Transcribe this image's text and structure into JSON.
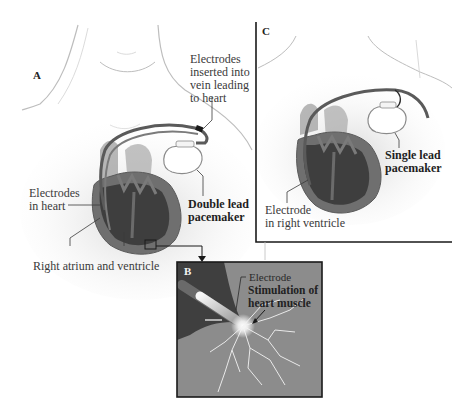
{
  "figure": {
    "type": "medical illustration",
    "colors": {
      "background": "#ffffff",
      "skin_outline": "#b8b8b8",
      "heart_dark": "#3c3c3c",
      "heart_mid": "#6d6d6d",
      "lead_wire": "#5a5a5a",
      "panel_border": "#1a1a1a",
      "panel_b_bg": "#8a8a8a",
      "spark": "#ffffff"
    }
  },
  "panels": {
    "a": {
      "letter": "A",
      "labels": {
        "electrodes_vein": [
          "Electrodes",
          "inserted into",
          "vein leading",
          "to heart"
        ],
        "electrodes_heart": [
          "Electrodes",
          "in heart"
        ],
        "double_lead": [
          "Double lead",
          "pacemaker"
        ],
        "right_atrium": "Right atrium and ventricle"
      }
    },
    "b": {
      "letter": "B",
      "labels": {
        "electrode": "Electrode",
        "stimulation": [
          "Stimulation of",
          "heart muscle"
        ]
      }
    },
    "c": {
      "letter": "C",
      "labels": {
        "single_lead": [
          "Single lead",
          "pacemaker"
        ],
        "electrode_rv": [
          "Electrode",
          "in right ventricle"
        ]
      }
    }
  }
}
